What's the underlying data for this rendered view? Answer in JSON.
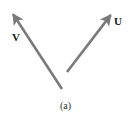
{
  "figure": {
    "caption": "(a)",
    "background_color": "#ffffff",
    "width": 131,
    "height": 122,
    "stroke_color": "#7a7a7a",
    "label_color": "#1a1a1a",
    "stroke_width": 2.6
  },
  "vectors": [
    {
      "id": "vector-v",
      "label": "V",
      "tail": {
        "x": 62,
        "y": 89
      },
      "tip": {
        "x": 11,
        "y": 11
      },
      "direction": "up-left",
      "arrowhead": "at-tip",
      "color": "#7a7a7a",
      "label_position": {
        "x": 12,
        "y": 32
      }
    },
    {
      "id": "vector-u",
      "label": "U",
      "tail": {
        "x": 67,
        "y": 72
      },
      "tip": {
        "x": 113,
        "y": 12
      },
      "direction": "up-right",
      "arrowhead": "at-tip",
      "color": "#7a7a7a",
      "label_position": {
        "x": 114,
        "y": 16
      }
    }
  ],
  "chart_data": {
    "type": "scatter",
    "title": "(a)",
    "xlabel": "",
    "ylabel": "",
    "series": [
      {
        "name": "V",
        "x": [
          62,
          11
        ],
        "y": [
          89,
          11
        ]
      },
      {
        "name": "U",
        "x": [
          67,
          72
        ],
        "y": [
          113,
          12
        ]
      }
    ],
    "annotations": [
      "V",
      "U",
      "(a)"
    ]
  }
}
